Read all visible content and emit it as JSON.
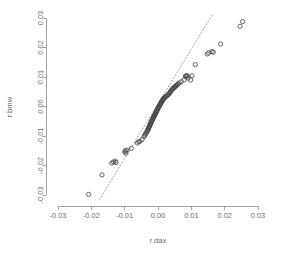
{
  "chart_data": {
    "type": "scatter",
    "title": "",
    "xlabel": "r.dax",
    "ylabel": "r.bmw",
    "xlim": [
      -0.03,
      0.03
    ],
    "ylim": [
      -0.03,
      0.03
    ],
    "xticks": [
      -0.03,
      -0.02,
      -0.01,
      0.0,
      0.01,
      0.02,
      0.03
    ],
    "xtick_labels": [
      "-0.03",
      "-0.02",
      "-0.01",
      "0.00",
      "0.01",
      "0.02",
      "0.03"
    ],
    "yticks": [
      -0.03,
      -0.02,
      -0.01,
      0.0,
      0.01,
      0.02,
      0.03
    ],
    "ytick_labels": [
      "-0.03",
      "-0.02",
      "-0.01",
      "0.00",
      "0.01",
      "0.02",
      "0.03"
    ],
    "grid": false,
    "legend": "none",
    "marker": "open-circle",
    "marker_color": "#4a4a4a",
    "reference_line": {
      "style": "dotted",
      "color": "#a0a0a0",
      "x_start": -0.0175,
      "y_start": -0.0315,
      "x_end": 0.0165,
      "y_end": 0.0315,
      "note": "qqline through first and third quartiles"
    },
    "points": [
      [
        -0.0208,
        -0.0298
      ],
      [
        -0.0168,
        -0.0232
      ],
      [
        -0.0139,
        -0.0192
      ],
      [
        -0.0134,
        -0.0188
      ],
      [
        -0.0128,
        -0.0185
      ],
      [
        -0.0126,
        -0.019
      ],
      [
        -0.01,
        -0.0154
      ],
      [
        -0.0098,
        -0.015
      ],
      [
        -0.0096,
        -0.0158
      ],
      [
        -0.0094,
        -0.0148
      ],
      [
        -0.008,
        -0.0142
      ],
      [
        -0.0062,
        -0.0124
      ],
      [
        -0.0058,
        -0.012
      ],
      [
        -0.0054,
        -0.0118
      ],
      [
        -0.0048,
        -0.0112
      ],
      [
        -0.0042,
        -0.0102
      ],
      [
        -0.004,
        -0.0098
      ],
      [
        -0.0038,
        -0.0094
      ],
      [
        -0.0036,
        -0.009
      ],
      [
        -0.0034,
        -0.0086
      ],
      [
        -0.0032,
        -0.0084
      ],
      [
        -0.0031,
        -0.0081
      ],
      [
        -0.003,
        -0.0078
      ],
      [
        -0.0029,
        -0.0076
      ],
      [
        -0.0028,
        -0.0072
      ],
      [
        -0.0027,
        -0.007
      ],
      [
        -0.0026,
        -0.0068
      ],
      [
        -0.0025,
        -0.0064
      ],
      [
        -0.0024,
        -0.0062
      ],
      [
        -0.0023,
        -0.006
      ],
      [
        -0.0022,
        -0.0058
      ],
      [
        -0.0021,
        -0.0055
      ],
      [
        -0.002,
        -0.0052
      ],
      [
        -0.0019,
        -0.005
      ],
      [
        -0.0018,
        -0.0047
      ],
      [
        -0.0017,
        -0.0045
      ],
      [
        -0.0016,
        -0.0043
      ],
      [
        -0.0015,
        -0.004
      ],
      [
        -0.0014,
        -0.0038
      ],
      [
        -0.0013,
        -0.0036
      ],
      [
        -0.0012,
        -0.0034
      ],
      [
        -0.0011,
        -0.0031
      ],
      [
        -0.001,
        -0.0029
      ],
      [
        -0.0009,
        -0.0027
      ],
      [
        -0.0008,
        -0.0025
      ],
      [
        -0.0007,
        -0.0022
      ],
      [
        -0.0006,
        -0.002
      ],
      [
        -0.0005,
        -0.0018
      ],
      [
        -0.0004,
        -0.0015
      ],
      [
        -0.0003,
        -0.0013
      ],
      [
        -0.0002,
        -0.0011
      ],
      [
        -0.0001,
        -0.0008
      ],
      [
        0.0,
        -0.0006
      ],
      [
        0.0001,
        -0.0004
      ],
      [
        0.0002,
        -0.0002
      ],
      [
        0.0003,
        0.0
      ],
      [
        0.0004,
        0.0002
      ],
      [
        0.0005,
        0.0004
      ],
      [
        0.0006,
        0.0006
      ],
      [
        0.0007,
        0.0008
      ],
      [
        0.0008,
        0.001
      ],
      [
        0.0009,
        0.0012
      ],
      [
        0.001,
        0.0014
      ],
      [
        0.0011,
        0.0016
      ],
      [
        0.0012,
        0.0018
      ],
      [
        0.0013,
        0.002
      ],
      [
        0.0014,
        0.0022
      ],
      [
        0.0015,
        0.0024
      ],
      [
        0.0016,
        0.0026
      ],
      [
        0.0018,
        0.0028
      ],
      [
        0.002,
        0.003
      ],
      [
        0.0022,
        0.0032
      ],
      [
        0.0024,
        0.0034
      ],
      [
        0.0026,
        0.0036
      ],
      [
        0.0028,
        0.0038
      ],
      [
        0.003,
        0.004
      ],
      [
        0.0032,
        0.0042
      ],
      [
        0.0034,
        0.0045
      ],
      [
        0.0036,
        0.0048
      ],
      [
        0.0038,
        0.0051
      ],
      [
        0.004,
        0.0054
      ],
      [
        0.0042,
        0.0057
      ],
      [
        0.0044,
        0.006
      ],
      [
        0.0046,
        0.0062
      ],
      [
        0.0048,
        0.0064
      ],
      [
        0.005,
        0.0066
      ],
      [
        0.0052,
        0.0068
      ],
      [
        0.0054,
        0.007
      ],
      [
        0.0056,
        0.0072
      ],
      [
        0.0058,
        0.0074
      ],
      [
        0.006,
        0.0076
      ],
      [
        0.0064,
        0.008
      ],
      [
        0.007,
        0.0084
      ],
      [
        0.0078,
        0.009
      ],
      [
        0.0082,
        0.0102
      ],
      [
        0.0084,
        0.0104
      ],
      [
        0.0086,
        0.0103
      ],
      [
        0.0088,
        0.0104
      ],
      [
        0.009,
        0.0096
      ],
      [
        0.0098,
        0.009
      ],
      [
        0.0102,
        0.0104
      ],
      [
        0.0112,
        0.0142
      ],
      [
        0.0148,
        0.0178
      ],
      [
        0.0152,
        0.0182
      ],
      [
        0.0162,
        0.0186
      ],
      [
        0.0166,
        0.0184
      ],
      [
        0.0188,
        0.0212
      ],
      [
        0.0246,
        0.0272
      ],
      [
        0.0254,
        0.0288
      ]
    ]
  },
  "plot_geometry": {
    "x_axis_px": {
      "min": 58,
      "max": 258
    },
    "y_axis_px": {
      "min": 195,
      "max": 18
    }
  }
}
